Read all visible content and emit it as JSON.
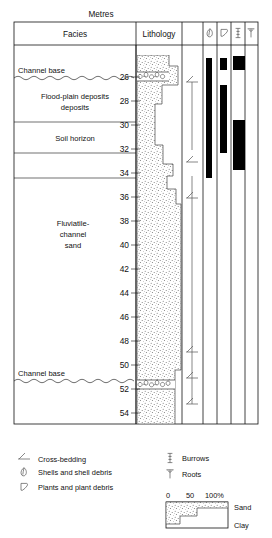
{
  "figure": {
    "title": "Metres",
    "columns": [
      {
        "id": "facies",
        "label": "Facies"
      },
      {
        "id": "lithology",
        "label": "Lithology"
      },
      {
        "id": "structures",
        "label": ""
      },
      {
        "id": "shells",
        "icon": "shell-icon"
      },
      {
        "id": "plants",
        "icon": "plant-icon"
      },
      {
        "id": "burrows",
        "icon": "burrow-icon"
      },
      {
        "id": "roots",
        "icon": "root-icon"
      }
    ]
  },
  "depth_axis": {
    "unit": "Metres",
    "ticks": [
      26,
      28,
      30,
      32,
      34,
      36,
      38,
      40,
      42,
      44,
      46,
      48,
      50,
      52,
      54
    ],
    "top_value": 24.6,
    "bottom_value": 55.2
  },
  "facies": [
    {
      "label": "Channel base",
      "type": "boundary",
      "depth": 26.1,
      "wavy": true
    },
    {
      "label": "Flood-plain deposits",
      "type": "unit",
      "from": 26.1,
      "to": 30.2
    },
    {
      "label": "Soil horizon",
      "type": "unit",
      "from": 30.2,
      "to": 32.3
    },
    {
      "label": "Fluviatile-channel sand",
      "type": "unit",
      "from": 32.3,
      "to": 51.2,
      "lines": [
        "Fluviatile-",
        "channel",
        "sand"
      ]
    },
    {
      "label": "Channel base",
      "type": "boundary",
      "depth": 51.2,
      "wavy": true
    }
  ],
  "lithology": {
    "pattern": "stipple-sand",
    "grain_profile": [
      {
        "depth": 24.7,
        "sand_pct": 72
      },
      {
        "depth": 25.6,
        "sand_pct": 72
      },
      {
        "depth": 25.6,
        "sand_pct": 92
      },
      {
        "depth": 27.1,
        "sand_pct": 92
      },
      {
        "depth": 27.1,
        "sand_pct": 56
      },
      {
        "depth": 28.6,
        "sand_pct": 56
      },
      {
        "depth": 28.6,
        "sand_pct": 40
      },
      {
        "depth": 31.8,
        "sand_pct": 40
      },
      {
        "depth": 31.8,
        "sand_pct": 62
      },
      {
        "depth": 33.3,
        "sand_pct": 62
      },
      {
        "depth": 33.3,
        "sand_pct": 80
      },
      {
        "depth": 34.2,
        "sand_pct": 80
      },
      {
        "depth": 34.2,
        "sand_pct": 70
      },
      {
        "depth": 35.2,
        "sand_pct": 70
      },
      {
        "depth": 35.2,
        "sand_pct": 86
      },
      {
        "depth": 36.4,
        "sand_pct": 86
      },
      {
        "depth": 36.4,
        "sand_pct": 97
      },
      {
        "depth": 50.6,
        "sand_pct": 97
      },
      {
        "depth": 50.6,
        "sand_pct": 88
      },
      {
        "depth": 55.1,
        "sand_pct": 88
      }
    ],
    "shell_beds": [
      26.1,
      51.3
    ]
  },
  "structures": {
    "cross_bedding_depths": [
      26.4,
      33.0,
      36.0,
      49.0,
      51.6,
      53.0
    ]
  },
  "occurrence_bars": {
    "shells": [
      {
        "from": 25.4,
        "to": 35.4
      }
    ],
    "plants": [
      {
        "from": 25.4,
        "to": 26.4
      },
      {
        "from": 27.8,
        "to": 33.2
      }
    ],
    "roots": [
      {
        "from": 25.2,
        "to": 26.6
      },
      {
        "from": 31.2,
        "to": 35.6
      }
    ]
  },
  "legend": {
    "left": [
      {
        "icon": "cross-bedding-icon",
        "label": "Cross-bedding"
      },
      {
        "icon": "shell-icon",
        "label": "Shells and shell debris"
      },
      {
        "icon": "plant-icon",
        "label": "Plants and plant debris"
      }
    ],
    "right": [
      {
        "icon": "burrow-icon",
        "label": "Burrows"
      },
      {
        "icon": "root-icon",
        "label": "Roots"
      }
    ]
  },
  "scale_key": {
    "ticks": [
      "0",
      "50",
      "100%"
    ],
    "sand_label": "Sand",
    "clay_label": "Clay"
  },
  "colors": {
    "ink": "#111111",
    "bar": "#000000",
    "stipple": "#6d6d6d",
    "rule": "#333333"
  }
}
